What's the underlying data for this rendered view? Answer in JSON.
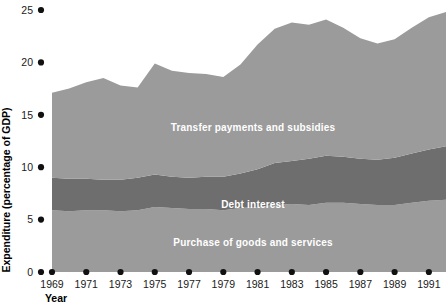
{
  "chart_data": {
    "type": "area",
    "stacked": true,
    "title": "",
    "subtitle": "",
    "xlabel": "Year",
    "ylabel": "Expenditure (percentage of GDP)",
    "xlim": [
      1969,
      1992
    ],
    "ylim": [
      0,
      25
    ],
    "grid": false,
    "legend_position": "inline-labels",
    "x_tick_labels": [
      "1969",
      "1971",
      "1973",
      "1975",
      "1977",
      "1979",
      "1981",
      "1983",
      "1985",
      "1987",
      "1989",
      "1991"
    ],
    "x_tick_values": [
      1969,
      1971,
      1973,
      1975,
      1977,
      1979,
      1981,
      1983,
      1985,
      1987,
      1989,
      1991
    ],
    "y_tick_labels": [
      "0",
      "5",
      "10",
      "15",
      "20",
      "25"
    ],
    "y_tick_values": [
      0,
      5,
      10,
      15,
      20,
      25
    ],
    "x": [
      1969,
      1970,
      1971,
      1972,
      1973,
      1974,
      1975,
      1976,
      1977,
      1978,
      1979,
      1980,
      1981,
      1982,
      1983,
      1984,
      1985,
      1986,
      1987,
      1988,
      1989,
      1990,
      1991,
      1992
    ],
    "series": [
      {
        "name": "Purchase of goods and services",
        "color": "#9b9b9b",
        "values": [
          5.9,
          5.8,
          5.9,
          5.9,
          5.8,
          5.9,
          6.2,
          6.1,
          6.0,
          6.0,
          5.9,
          6.1,
          6.2,
          6.4,
          6.5,
          6.4,
          6.6,
          6.6,
          6.5,
          6.4,
          6.4,
          6.6,
          6.8,
          6.9
        ]
      },
      {
        "name": "Debt interest",
        "color": "#6e6e6e",
        "values": [
          3.1,
          3.1,
          3.0,
          2.9,
          3.0,
          3.1,
          3.1,
          3.0,
          3.0,
          3.1,
          3.2,
          3.3,
          3.6,
          4.0,
          4.1,
          4.4,
          4.5,
          4.4,
          4.3,
          4.3,
          4.5,
          4.7,
          4.9,
          5.1
        ]
      },
      {
        "name": "Transfer payments and subsidies",
        "color": "#9b9b9b",
        "values": [
          8.1,
          8.6,
          9.2,
          9.7,
          9.0,
          8.6,
          10.6,
          10.1,
          10.0,
          9.8,
          9.5,
          10.4,
          11.9,
          12.8,
          13.2,
          12.8,
          13.0,
          12.3,
          11.5,
          11.1,
          11.3,
          12.0,
          12.6,
          12.8
        ]
      }
    ],
    "series_total": [
      17.1,
      17.5,
      18.1,
      18.5,
      17.8,
      17.6,
      19.9,
      19.2,
      19.0,
      18.9,
      18.6,
      19.8,
      21.7,
      23.2,
      23.8,
      23.6,
      24.1,
      23.3,
      22.3,
      21.8,
      22.2,
      23.3,
      24.3,
      24.8
    ]
  },
  "labels": {
    "y_axis_title": "Expenditure (percentage of GDP)",
    "x_axis_title": "Year",
    "band_top": "Transfer payments and subsidies",
    "band_middle": "Debt interest",
    "band_bottom": "Purchase of goods and services"
  },
  "y_ticks": [
    {
      "label": "25",
      "value": 25
    },
    {
      "label": "20",
      "value": 20
    },
    {
      "label": "15",
      "value": 15
    },
    {
      "label": "10",
      "value": 10
    },
    {
      "label": "5",
      "value": 5
    },
    {
      "label": "0",
      "value": 0
    }
  ],
  "x_ticks": [
    {
      "label": "1969",
      "value": 1969
    },
    {
      "label": "1971",
      "value": 1971
    },
    {
      "label": "1973",
      "value": 1973
    },
    {
      "label": "1975",
      "value": 1975
    },
    {
      "label": "1977",
      "value": 1977
    },
    {
      "label": "1979",
      "value": 1979
    },
    {
      "label": "1981",
      "value": 1981
    },
    {
      "label": "1983",
      "value": 1983
    },
    {
      "label": "1985",
      "value": 1985
    },
    {
      "label": "1987",
      "value": 1987
    },
    {
      "label": "1989",
      "value": 1989
    },
    {
      "label": "1991",
      "value": 1991
    }
  ],
  "colors": {
    "light_band": "#9b9b9b",
    "dark_band": "#6e6e6e",
    "tick_dot": "#111111",
    "text": "#000000",
    "inline_label": "#ffffff",
    "background": "#ffffff"
  }
}
